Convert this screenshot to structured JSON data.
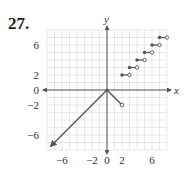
{
  "problem": {
    "number": "27."
  },
  "chart_data": {
    "type": "line",
    "title": "",
    "xlabel": "x",
    "ylabel": "y",
    "xlim": [
      -8,
      8
    ],
    "ylim": [
      -8,
      8
    ],
    "grid": true,
    "x_tick_labels": [
      "-6",
      "-2",
      "0",
      "2",
      "6"
    ],
    "x_ticks": [
      -6,
      -2,
      0,
      2,
      6
    ],
    "y_tick_labels": [
      "6",
      "2",
      "0",
      "-2",
      "-6"
    ],
    "y_ticks": [
      6,
      2,
      0,
      -2,
      -6
    ],
    "series": [
      {
        "name": "ray-to-lower-left",
        "kind": "ray",
        "points": [
          [
            0,
            0
          ],
          [
            -7.5,
            -7.5
          ]
        ],
        "arrow_end": true
      },
      {
        "name": "segment-to-(2,-2)",
        "kind": "segment",
        "points": [
          [
            0,
            0
          ],
          [
            2,
            -2
          ]
        ],
        "start": "closed",
        "end": "open"
      },
      {
        "name": "steps",
        "kind": "step",
        "segments": [
          {
            "x0": 2,
            "x1": 3,
            "y": 2,
            "left": "closed",
            "right": "open"
          },
          {
            "x0": 3,
            "x1": 4,
            "y": 3,
            "left": "closed",
            "right": "open"
          },
          {
            "x0": 4,
            "x1": 5,
            "y": 4,
            "left": "closed",
            "right": "open"
          },
          {
            "x0": 5,
            "x1": 6,
            "y": 5,
            "left": "closed",
            "right": "open"
          },
          {
            "x0": 6,
            "x1": 7,
            "y": 6,
            "left": "closed",
            "right": "open"
          },
          {
            "x0": 7,
            "x1": 8,
            "y": 7,
            "left": "closed",
            "right": "open"
          }
        ]
      }
    ],
    "colors": {
      "grid": "#d9d9d9",
      "axis": "#555555",
      "curve": "#555555"
    }
  }
}
